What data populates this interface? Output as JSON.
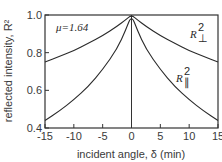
{
  "chart_data": {
    "type": "line",
    "title": "",
    "xlabel": "incident angle, δ (min)",
    "ylabel": "reflected intensity, R²",
    "xlim": [
      -15,
      15
    ],
    "ylim": [
      0.4,
      1.0
    ],
    "xticks": [
      -15,
      -10,
      -5,
      0,
      5,
      10,
      15
    ],
    "xtick_labels": [
      "-15",
      "-10",
      "-5",
      "0",
      "5",
      "10",
      "15"
    ],
    "yticks": [
      0.4,
      0.6,
      0.8,
      1.0
    ],
    "ytick_labels": [
      "0.4",
      "0.6",
      "0.8",
      "1.0"
    ],
    "grid": false,
    "legend": "none (inline labels)",
    "annotations": [
      {
        "text": "μ=1.64",
        "x": -11,
        "y": 0.94
      },
      {
        "text": "R⊥²",
        "x": 11,
        "y": 0.9,
        "series": "R_perp"
      },
      {
        "text": "R∥²",
        "x": 11,
        "y": 0.64,
        "series": "R_par"
      }
    ],
    "vertical_line": {
      "x": 0
    },
    "x": [
      -15,
      -12.5,
      -10,
      -7.5,
      -5,
      -2.5,
      -1,
      0,
      1,
      2.5,
      5,
      7.5,
      10,
      12.5,
      15
    ],
    "series": [
      {
        "name": "R⊥²",
        "values": [
          0.75,
          0.78,
          0.81,
          0.85,
          0.89,
          0.94,
          0.975,
          1.0,
          0.975,
          0.94,
          0.89,
          0.85,
          0.81,
          0.78,
          0.75
        ]
      },
      {
        "name": "R∥²",
        "values": [
          0.44,
          0.49,
          0.55,
          0.62,
          0.71,
          0.82,
          0.92,
          1.0,
          0.92,
          0.82,
          0.71,
          0.62,
          0.55,
          0.49,
          0.44
        ]
      }
    ]
  },
  "labels": {
    "mu": "μ=1.64",
    "r_perp": "R",
    "r_perp_sup": "2",
    "r_perp_sub": "⊥",
    "r_par": "R",
    "r_par_sup": "2",
    "r_par_sub": "∥",
    "xlabel": "incident angle, δ (min)",
    "ylabel": "reflected intensity, R²"
  }
}
